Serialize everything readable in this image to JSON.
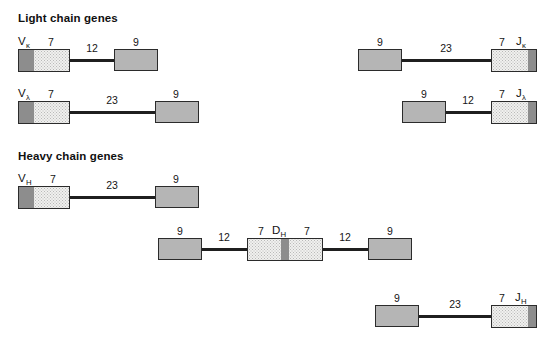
{
  "figure": {
    "sections": [
      {
        "id": "light",
        "title": "Light chain genes"
      },
      {
        "id": "heavy",
        "title": "Heavy chain genes"
      }
    ],
    "colors": {
      "dark_gray": "#8d8d8d",
      "light_stipple": "#f0f0ee",
      "solid_gray": "#b5b5b5",
      "outline": "#2b2b2b",
      "line": "#1f1f1f"
    }
  },
  "rows": [
    {
      "id": "v-kappa",
      "gene_label": "V",
      "gene_subscript": "κ",
      "heptamer": "7",
      "spacer": "12",
      "nonamer": "9"
    },
    {
      "id": "v-lambda",
      "gene_label": "V",
      "gene_subscript": "λ",
      "heptamer": "7",
      "spacer": "23",
      "nonamer": "9"
    },
    {
      "id": "j-kappa",
      "gene_label": "J",
      "gene_subscript": "κ",
      "heptamer": "7",
      "spacer": "23",
      "nonamer": "9"
    },
    {
      "id": "j-lambda",
      "gene_label": "J",
      "gene_subscript": "λ",
      "heptamer": "7",
      "spacer": "12",
      "nonamer": "9"
    },
    {
      "id": "v-heavy",
      "gene_label": "V",
      "gene_subscript": "H",
      "heptamer": "7",
      "spacer": "23",
      "nonamer": "9"
    },
    {
      "id": "d-heavy",
      "gene_label": "D",
      "gene_subscript": "H",
      "heptamer_left": "7",
      "heptamer_right": "7",
      "spacer_left": "12",
      "spacer_right": "12",
      "nonamer_left": "9",
      "nonamer_right": "9"
    },
    {
      "id": "j-heavy",
      "gene_label": "J",
      "gene_subscript": "H",
      "heptamer": "7",
      "spacer": "23",
      "nonamer": "9"
    }
  ]
}
